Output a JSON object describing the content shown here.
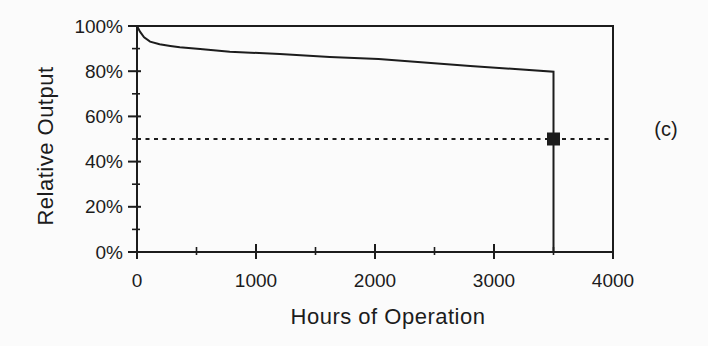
{
  "colors": {
    "ink": "#1c1c1c",
    "background": "#fbfbfb"
  },
  "chart_data": {
    "type": "line",
    "title": "",
    "xlabel": "Hours of Operation",
    "ylabel": "Relative Output",
    "xlim": [
      0,
      4000
    ],
    "ylim": [
      0,
      100
    ],
    "grid": false,
    "legend": "none",
    "x_major_ticks": [
      0,
      1000,
      2000,
      3000,
      4000
    ],
    "x_tick_labels": [
      "0",
      "1000",
      "2000",
      "3000",
      "4000"
    ],
    "x_minor_ticks": [
      500,
      1500,
      2500,
      3500
    ],
    "y_major_ticks": [
      0,
      20,
      40,
      60,
      80,
      100
    ],
    "y_tick_labels": [
      "0%",
      "20%",
      "40%",
      "60%",
      "80%",
      "100%"
    ],
    "y_minor_ticks": [
      10,
      30,
      50,
      70,
      90
    ],
    "series": [
      {
        "name": "relative-output-curve",
        "style": "solid",
        "points": [
          [
            0,
            100
          ],
          [
            25,
            97.5
          ],
          [
            60,
            95
          ],
          [
            110,
            93.1
          ],
          [
            190,
            91.9
          ],
          [
            280,
            91.2
          ],
          [
            360,
            90.6
          ],
          [
            530,
            89.8
          ],
          [
            780,
            88.6
          ],
          [
            1200,
            87.6
          ],
          [
            1620,
            86.3
          ],
          [
            2030,
            85.4
          ],
          [
            2800,
            82.3
          ],
          [
            3500,
            79.8
          ],
          [
            3500,
            0
          ]
        ]
      },
      {
        "name": "fifty-percent-threshold-line",
        "style": "dashed",
        "points": [
          [
            0,
            50
          ],
          [
            4000,
            50
          ]
        ]
      }
    ],
    "markers": [
      {
        "shape": "filled-square",
        "x": 3500,
        "y": 50,
        "size": 13,
        "color": "#1c1c1c"
      }
    ],
    "annotations": [
      {
        "text": "(c)",
        "role": "panel-label",
        "position": "right-of-plot"
      }
    ]
  }
}
